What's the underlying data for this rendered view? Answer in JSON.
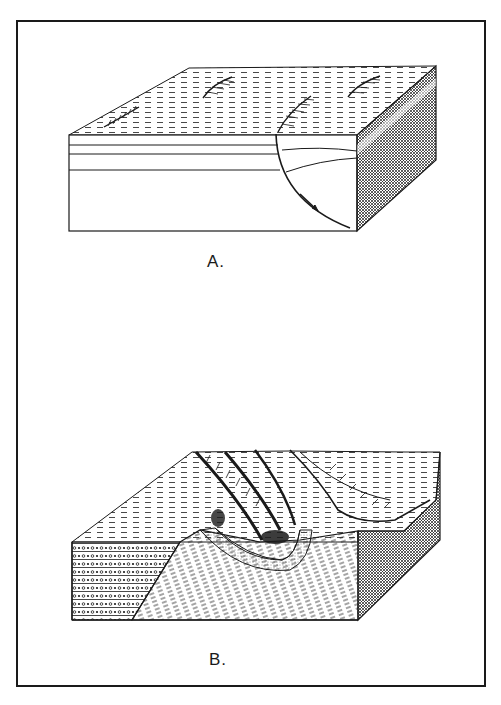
{
  "figure": {
    "panels": [
      {
        "id": "A",
        "label": "A.",
        "description": "Block diagram of a listric normal fault with curved fault plane and displacement arrow; surface scarps on plain",
        "features": [
          "surface-scarp",
          "surface-scarp",
          "surface-scarp",
          "surface-scarp",
          "listric-fault-plane",
          "displacement-arrow",
          "horizontal-strata",
          "cross-hatched-side-face"
        ]
      },
      {
        "id": "B",
        "label": "B.",
        "description": "Block diagram of an eroded syncline/fold forming ridges, with dotted conglomerate beds on left face and dashed curved strata",
        "features": [
          "ridges",
          "fold-core",
          "dotted-conglomerate-beds",
          "dashed-curved-strata",
          "cross-hatched-side-face"
        ]
      }
    ],
    "colors": {
      "ink": "#1a1a1a",
      "paper": "#ffffff"
    }
  }
}
